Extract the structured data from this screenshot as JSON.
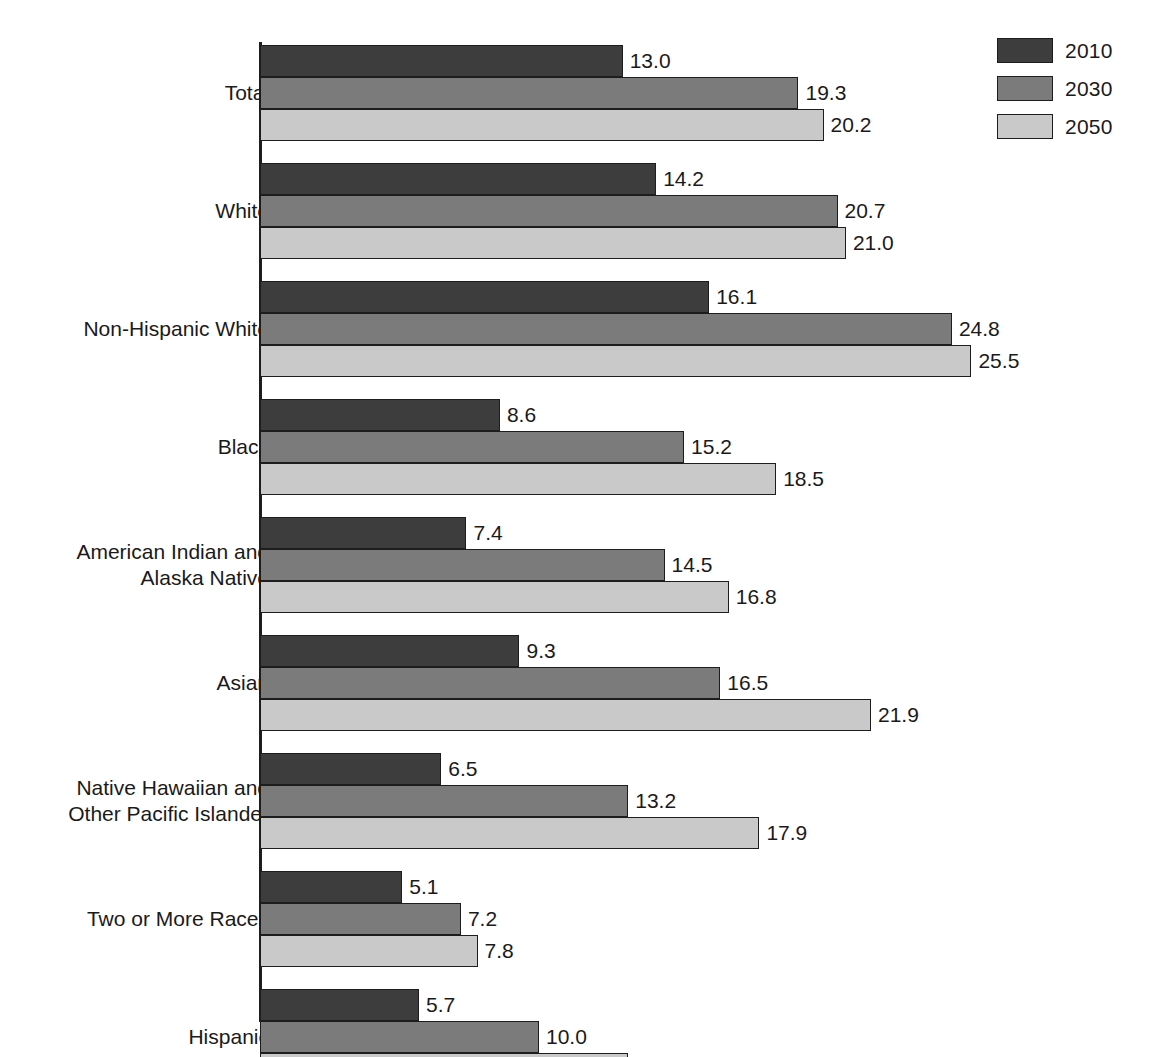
{
  "legend": {
    "position": "top-right",
    "entries": [
      {
        "label": "2010",
        "color": "#3d3d3d"
      },
      {
        "label": "2030",
        "color": "#7b7b7b"
      },
      {
        "label": "2050",
        "color": "#c9c9c9"
      }
    ]
  },
  "chart_data": {
    "type": "bar",
    "orientation": "horizontal",
    "title": "",
    "subtitle": "",
    "xlabel": "",
    "ylabel": "",
    "xlim": [
      0,
      25.5
    ],
    "grid": false,
    "legend_position": "top-right",
    "categories": [
      "Total",
      "White",
      "Non-Hispanic White",
      "Black",
      "American Indian and\nAlaska Native",
      "Asian",
      "Native Hawaiian and\nOther Pacific Islander",
      "Two or More Races",
      "Hispanic"
    ],
    "series": [
      {
        "name": "2010",
        "color": "#3d3d3d",
        "values": [
          13.0,
          14.2,
          16.1,
          8.6,
          7.4,
          9.3,
          6.5,
          5.1,
          5.7
        ]
      },
      {
        "name": "2030",
        "color": "#7b7b7b",
        "values": [
          19.3,
          20.7,
          24.8,
          15.2,
          14.5,
          16.5,
          13.2,
          7.2,
          10.0
        ]
      },
      {
        "name": "2050",
        "color": "#c9c9c9",
        "values": [
          20.2,
          21.0,
          25.5,
          18.5,
          16.8,
          21.9,
          17.9,
          7.8,
          13.2
        ]
      }
    ],
    "value_labels": [
      [
        "13.0",
        "19.3",
        "20.2"
      ],
      [
        "14.2",
        "20.7",
        "21.0"
      ],
      [
        "16.1",
        "24.8",
        "25.5"
      ],
      [
        "8.6",
        "15.2",
        "18.5"
      ],
      [
        "7.4",
        "14.5",
        "16.8"
      ],
      [
        "9.3",
        "16.5",
        "21.9"
      ],
      [
        "6.5",
        "13.2",
        "17.9"
      ],
      [
        "5.1",
        "7.2",
        "7.8"
      ],
      [
        "5.7",
        "10.0",
        "13.2"
      ]
    ]
  }
}
